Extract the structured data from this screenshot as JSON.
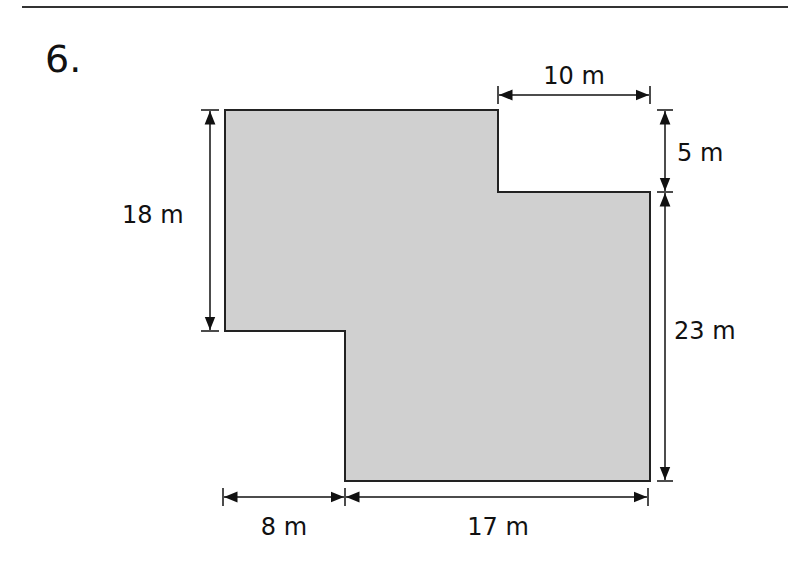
{
  "problem": {
    "number": "6."
  },
  "figure": {
    "shape": "compound rectilinear polygon",
    "fill_color": "#d0d0d0",
    "stroke_color": "#222222",
    "dimensions": {
      "top_gap_width": "10 m",
      "top_gap_height": "5 m",
      "left_height": "18 m",
      "right_height": "23 m",
      "bottom_left_offset": "8 m",
      "bottom_width": "17 m"
    }
  }
}
